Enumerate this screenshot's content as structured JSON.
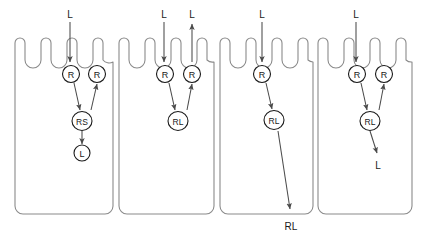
{
  "figure": {
    "type": "schematic-diagram",
    "panel_count": 4,
    "colors": {
      "outline": "#8a8a8a",
      "node_stroke": "#1a1a1a",
      "arrow": "#4a4a4a",
      "background": "#ffffff",
      "text": "#1a1a1a"
    }
  },
  "panels": [
    {
      "id": "panel-1",
      "top_labels": [
        {
          "text": "L",
          "x": 70,
          "y": 14,
          "arrow": "down"
        }
      ],
      "bottom_labels": [],
      "nodes": [
        {
          "id": "p1-r-left",
          "text": "R",
          "x": 71,
          "y": 74,
          "rx": 8.5,
          "ry": 8.5
        },
        {
          "id": "p1-r-right",
          "text": "R",
          "x": 97,
          "y": 74,
          "rx": 8.5,
          "ry": 8.5
        },
        {
          "id": "p1-rs",
          "text": "RS",
          "x": 82,
          "y": 121,
          "rx": 10,
          "ry": 9.5
        },
        {
          "id": "p1-l",
          "text": "L",
          "x": 82,
          "y": 153,
          "rx": 8,
          "ry": 8
        }
      ],
      "edges": [
        {
          "from": "label-L",
          "to": "p1-r-left",
          "kind": "entry-down"
        },
        {
          "from": "p1-r-left",
          "to": "p1-rs",
          "kind": "diagonal"
        },
        {
          "from": "p1-r-right",
          "to": "p1-rs",
          "kind": "diagonal-reverse"
        },
        {
          "from": "p1-rs",
          "to": "p1-l",
          "kind": "vertical-down"
        }
      ]
    },
    {
      "id": "panel-2",
      "top_labels": [
        {
          "text": "L",
          "x": 164,
          "y": 14,
          "arrow": "down"
        },
        {
          "text": "L",
          "x": 192,
          "y": 14,
          "arrow": "up"
        }
      ],
      "bottom_labels": [],
      "nodes": [
        {
          "id": "p2-r-left",
          "text": "R",
          "x": 165,
          "y": 74,
          "rx": 8.5,
          "ry": 8.5
        },
        {
          "id": "p2-r-right",
          "text": "R",
          "x": 192,
          "y": 74,
          "rx": 8.5,
          "ry": 8.5
        },
        {
          "id": "p2-rl",
          "text": "RL",
          "x": 178,
          "y": 121,
          "rx": 10,
          "ry": 9.5
        }
      ],
      "edges": [
        {
          "from": "label-L",
          "to": "p2-r-left",
          "kind": "entry-down"
        },
        {
          "from": "p2-r-right",
          "to": "label-L",
          "kind": "exit-up"
        },
        {
          "from": "p2-r-left",
          "to": "p2-rl",
          "kind": "diagonal"
        },
        {
          "from": "p2-r-right",
          "to": "p2-rl",
          "kind": "diagonal-reverse"
        }
      ]
    },
    {
      "id": "panel-3",
      "top_labels": [
        {
          "text": "L",
          "x": 262,
          "y": 14,
          "arrow": "down"
        }
      ],
      "bottom_labels": [
        {
          "text": "RL",
          "x": 291,
          "y": 226
        }
      ],
      "nodes": [
        {
          "id": "p3-r",
          "text": "R",
          "x": 262,
          "y": 74,
          "rx": 8.5,
          "ry": 8.5
        },
        {
          "id": "p3-rl",
          "text": "RL",
          "x": 274,
          "y": 120,
          "rx": 10,
          "ry": 9.5
        }
      ],
      "edges": [
        {
          "from": "label-L",
          "to": "p3-r",
          "kind": "entry-down"
        },
        {
          "from": "p3-r",
          "to": "p3-rl",
          "kind": "diagonal"
        },
        {
          "from": "p3-rl",
          "to": "label-RL",
          "kind": "long-diagonal-exit"
        }
      ]
    },
    {
      "id": "panel-4",
      "top_labels": [
        {
          "text": "L",
          "x": 356,
          "y": 14,
          "arrow": "down"
        }
      ],
      "bottom_labels": [
        {
          "text": "L",
          "x": 378,
          "y": 165
        }
      ],
      "nodes": [
        {
          "id": "p4-r-left",
          "text": "R",
          "x": 357,
          "y": 74,
          "rx": 8.5,
          "ry": 8.5
        },
        {
          "id": "p4-r-right",
          "text": "R",
          "x": 384,
          "y": 74,
          "rx": 8.5,
          "ry": 8.5
        },
        {
          "id": "p4-rl",
          "text": "RL",
          "x": 370,
          "y": 121,
          "rx": 10,
          "ry": 9.5
        }
      ],
      "edges": [
        {
          "from": "label-L",
          "to": "p4-r-left",
          "kind": "entry-down"
        },
        {
          "from": "p4-r-left",
          "to": "p4-rl",
          "kind": "diagonal"
        },
        {
          "from": "p4-r-right",
          "to": "p4-rl",
          "kind": "diagonal-reverse"
        },
        {
          "from": "p4-rl",
          "to": "label-L",
          "kind": "vertical-down-exit"
        }
      ]
    }
  ],
  "node_labels": {
    "R": "R",
    "RS": "RS",
    "RL": "RL",
    "L": "L"
  }
}
